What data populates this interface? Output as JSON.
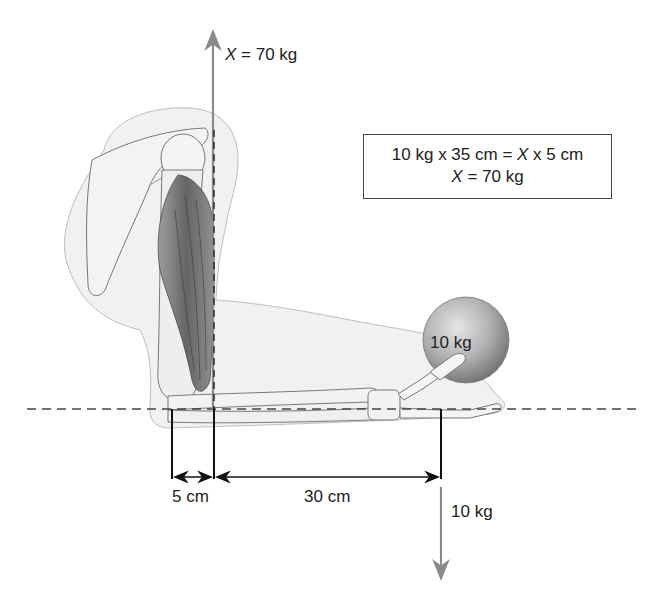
{
  "diagram": {
    "muscle_force_label": {
      "var": "X",
      "rest": " = 70 kg"
    },
    "equation_box": {
      "line1_pre": "10 kg x 35 cm = ",
      "line1_var": "X",
      "line1_post": " x 5 cm",
      "line2_var": "X",
      "line2_post": " = 70 kg"
    },
    "ball_label": "10 kg",
    "load_force_label": "10 kg",
    "dimensions": [
      {
        "id": "effort-arm",
        "label": "5 cm"
      },
      {
        "id": "load-arm",
        "label": "30 cm"
      }
    ],
    "colors": {
      "force_arrow": "#8a8a8a",
      "dimension_line": "#111111",
      "dashed_reference": "#444444",
      "body_silhouette": "#efefef",
      "bone": "#f2f2f2",
      "muscle": "#6f6f6f",
      "ball": "#9a9a9a"
    }
  }
}
